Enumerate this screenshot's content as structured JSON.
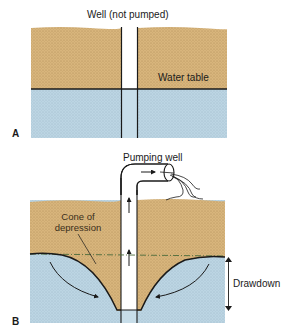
{
  "panels": [
    {
      "id": "A",
      "letter": "A",
      "well_label": "Well (not pumped)",
      "water_table_label": "Water table"
    },
    {
      "id": "B",
      "letter": "B",
      "well_label": "Pumping well",
      "cone_label_line1": "Cone of",
      "cone_label_line2": "depression",
      "drawdown_label": "Drawdown"
    }
  ],
  "colors": {
    "sand": "#d8b57c",
    "sand_dot": "#a8844c",
    "water": "#bcd5e3",
    "water_dot": "#7e9fb4",
    "line": "#1a1a1a",
    "dashed_line": "#4a6a3a"
  }
}
